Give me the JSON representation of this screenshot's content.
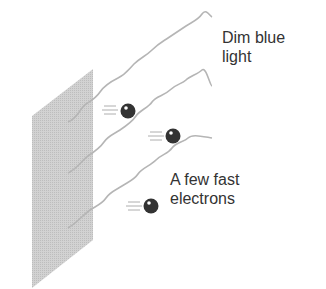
{
  "diagram": {
    "labels": {
      "light": [
        "Dim blue",
        "light"
      ],
      "electrons": [
        "A few fast",
        "electrons"
      ]
    },
    "elements": {
      "plate": "metal-plate",
      "waves": [
        "light-wave-1",
        "light-wave-2",
        "light-wave-3"
      ],
      "electrons": [
        "electron-1",
        "electron-2",
        "electron-3"
      ]
    },
    "colors": {
      "plate": "#c8c8c8",
      "wave": "#b5b5b5",
      "electron": "#333333",
      "text": "#333333"
    }
  }
}
